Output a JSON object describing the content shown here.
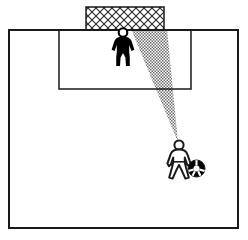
{
  "diagram": {
    "title": "Soccer goalkeeper shot-blocking angle diagram",
    "type": "tactical-diagram",
    "canvas": {
      "width": 248,
      "height": 240
    },
    "colors": {
      "line": "#1a1a1a",
      "background": "#ffffff",
      "shading": "#8a8a8a",
      "figure_fill_keeper": "#000000",
      "figure_fill_striker": "#ffffff",
      "ball_fill": "#000000",
      "net_line": "#333333"
    },
    "field": {
      "label": "pitch-boundary",
      "shape": "rectangle",
      "x": 9,
      "y": 30,
      "width": 229,
      "height": 198,
      "stroke_width": 2
    },
    "penalty_area": {
      "label": "penalty-area",
      "shape": "rectangle",
      "x": 59,
      "y": 30,
      "width": 132,
      "height": 59,
      "stroke_width": 1.5
    },
    "goal": {
      "label": "goal-net",
      "shape": "rectangle",
      "x": 86,
      "y": 7,
      "width": 78,
      "height": 23,
      "pattern": "diagonal-crosshatch",
      "stroke_width": 1.5
    },
    "shading_cone": {
      "label": "blocked-angle-cone",
      "shape": "triangle",
      "description": "Stippled gray cone from ball to goal showing the angle covered by the goalkeeper",
      "apex": {
        "x": 178,
        "y": 142
      },
      "base_left": {
        "x": 131,
        "y": 29
      },
      "base_right": {
        "x": 167,
        "y": 29
      },
      "pattern": "stipple-dots"
    },
    "goalkeeper": {
      "label": "goalkeeper-figure",
      "style": "solid-black-pictogram",
      "x": 112,
      "y": 29,
      "width": 22,
      "height": 37,
      "head_radius": 4.2
    },
    "striker": {
      "label": "striker-figure",
      "style": "outlined-white-pictogram",
      "x": 167,
      "y": 139,
      "width": 26,
      "height": 40,
      "head_radius": 4.6
    },
    "ball": {
      "label": "soccer-ball",
      "shape": "circle",
      "cx": 196.5,
      "cy": 168.5,
      "r": 8.5,
      "style": "black-with-white-panels"
    }
  }
}
